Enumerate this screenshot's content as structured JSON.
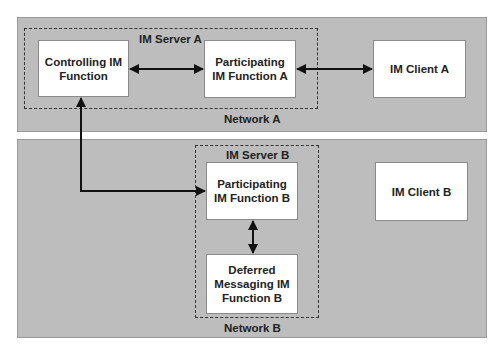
{
  "networks": {
    "a": {
      "label": "Network A"
    },
    "b": {
      "label": "Network B"
    }
  },
  "servers": {
    "a": {
      "label": "IM Server A"
    },
    "b": {
      "label": "IM Server B"
    }
  },
  "nodes": {
    "controlling": {
      "label": "Controlling IM\nFunction"
    },
    "participating_a": {
      "label": "Participating\nIM Function A"
    },
    "client_a": {
      "label": "IM Client A"
    },
    "participating_b": {
      "label": "Participating\nIM Function B"
    },
    "deferred_b": {
      "label": "Deferred\nMessaging IM\nFunction B"
    },
    "client_b": {
      "label": "IM Client B"
    }
  },
  "connections": [
    {
      "from": "controlling",
      "to": "participating_a",
      "type": "bidirectional"
    },
    {
      "from": "participating_a",
      "to": "client_a",
      "type": "bidirectional"
    },
    {
      "from": "controlling",
      "to": "participating_b",
      "type": "bidirectional-elbow"
    },
    {
      "from": "participating_b",
      "to": "deferred_b",
      "type": "bidirectional"
    }
  ]
}
